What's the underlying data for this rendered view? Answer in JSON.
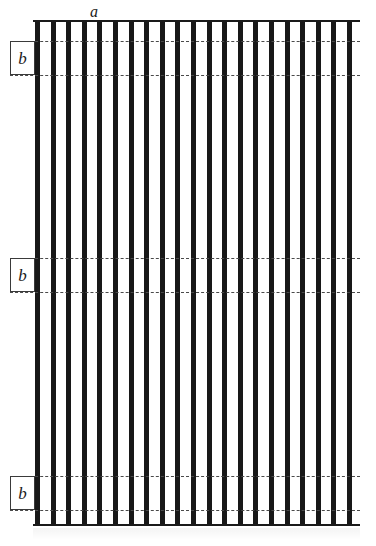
{
  "figure": {
    "type": "technical-line-drawing",
    "canvas": {
      "width": 376,
      "height": 546,
      "background": "#ffffff"
    },
    "ink_color": "#181818",
    "reference_line_color": "#4a4a4a"
  },
  "labels": {
    "a": {
      "text": "a",
      "x": 90,
      "y": 4,
      "description": "pitch / width dimension label above the plate"
    },
    "b_boxes": [
      {
        "text": "b",
        "x": 10,
        "y": 41,
        "width": 25,
        "height": 34
      },
      {
        "text": "b",
        "x": 10,
        "y": 258,
        "width": 25,
        "height": 34
      },
      {
        "text": "b",
        "x": 10,
        "y": 476,
        "width": 25,
        "height": 34
      }
    ]
  },
  "plate": {
    "x": 33,
    "y": 20,
    "width": 327,
    "height": 506,
    "top_line_y": 20,
    "bottom_line_y": 524,
    "bar_count": 21,
    "bar_width": 5,
    "bar_pitch": 15.6,
    "bar_color": "#181818"
  },
  "reference_lines": [
    {
      "y": 41,
      "x_start": 10,
      "x_end": 360,
      "style": "dash-dot"
    },
    {
      "y": 75,
      "x_start": 10,
      "x_end": 360,
      "style": "dash-dot"
    },
    {
      "y": 258,
      "x_start": 10,
      "x_end": 360,
      "style": "dash-dot"
    },
    {
      "y": 292,
      "x_start": 10,
      "x_end": 360,
      "style": "dash-dot"
    },
    {
      "y": 476,
      "x_start": 10,
      "x_end": 360,
      "style": "dash-dot"
    },
    {
      "y": 510,
      "x_start": 10,
      "x_end": 360,
      "style": "dash-dot"
    }
  ]
}
